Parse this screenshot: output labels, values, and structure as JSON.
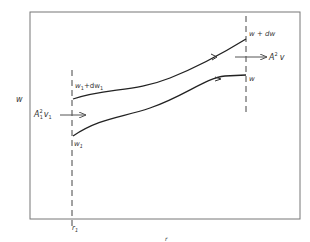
{
  "figure": {
    "y_axis_label": "w",
    "x_axis_label": "r",
    "left_boundary_label": "r",
    "left_boundary_sub": "1",
    "upper_left_label": "w",
    "upper_left_sub": "1",
    "upper_left_suffix": "+dw",
    "upper_left_suffix_sub": "1",
    "lower_left_label": "w",
    "lower_left_sub": "1",
    "upper_right_label": "w + dw",
    "lower_right_label": "w",
    "inflow_label": "A",
    "inflow_sup": "2",
    "inflow_sub": "1",
    "inflow_v": "v",
    "inflow_v_sub": "1",
    "outflow_label": "A",
    "outflow_sup": "2",
    "outflow_v": "v",
    "line_color": "#222222",
    "frame_color": "#666666"
  }
}
